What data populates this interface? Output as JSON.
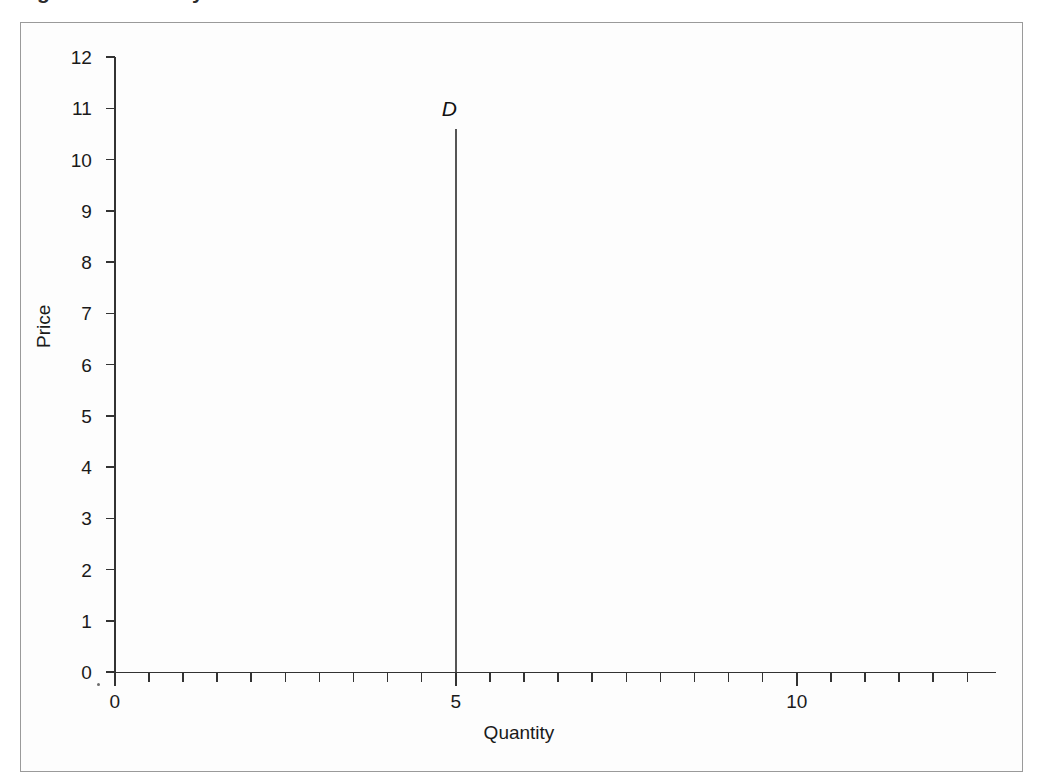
{
  "figure": {
    "caption_cutoff": "Figure 1.  Perfectly inelastic demand",
    "background_color": "#fdfdfd",
    "frame_color": "#9a9a9a"
  },
  "chart_data": {
    "type": "line",
    "title": "",
    "subtitle": "",
    "xlabel": "Quantity",
    "ylabel": "Price",
    "xlim": [
      0,
      12.9
    ],
    "ylim": [
      0,
      12
    ],
    "grid": false,
    "legend": false,
    "x_ticks_major": [
      0,
      5,
      10
    ],
    "x_tick_labels": [
      "0",
      "5",
      "10"
    ],
    "x_tick_minor_step": 0.5,
    "y_ticks": [
      0,
      1,
      2,
      3,
      4,
      5,
      6,
      7,
      8,
      9,
      10,
      11,
      12
    ],
    "y_tick_labels": [
      "12",
      "11",
      "10",
      "9",
      "8",
      "7",
      "6",
      "5",
      "4",
      "3",
      "2",
      "1",
      "0"
    ],
    "series": [
      {
        "name": "D",
        "label": "D",
        "label_italic": true,
        "color": "#555555",
        "description": "Perfectly inelastic demand: vertical line at Quantity = 5",
        "x": [
          5,
          5
        ],
        "y": [
          0,
          10.6
        ]
      }
    ],
    "annotations": [
      {
        "text": "D",
        "x": 5,
        "y": 11.0,
        "style": "italic"
      }
    ]
  },
  "axis_colors": {
    "axis_line": "#333333",
    "tick": "#333333",
    "text": "#1a1a1a"
  }
}
